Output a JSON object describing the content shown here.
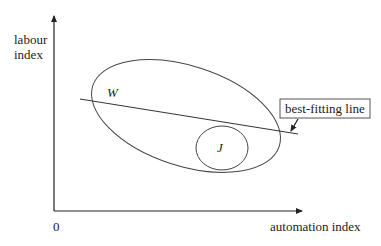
{
  "axes": {
    "y_label_line1": "labour",
    "y_label_line2": "index",
    "x_label": "automation index",
    "origin": "0"
  },
  "regions": {
    "outer_label": "W",
    "inner_label": "J"
  },
  "callout": {
    "label": "best-fitting line"
  },
  "colors": {
    "stroke": "#333333",
    "background": "#ffffff"
  }
}
